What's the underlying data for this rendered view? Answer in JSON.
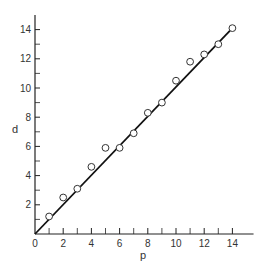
{
  "chart_data": {
    "type": "scatter",
    "title": "",
    "xlabel": "p",
    "ylabel": "d",
    "xlim": [
      0,
      15.5
    ],
    "ylim": [
      0,
      15
    ],
    "grid": false,
    "legend": null,
    "x_ticks_major": [
      0,
      2,
      4,
      6,
      8,
      10,
      12,
      14
    ],
    "x_tick_labels": [
      "0",
      "2",
      "4",
      "6",
      "8",
      "10",
      "12",
      "14"
    ],
    "x_ticks_minor": [
      1,
      3,
      5,
      7,
      9,
      11,
      13
    ],
    "y_ticks_major": [
      2,
      4,
      6,
      8,
      10,
      12,
      14
    ],
    "y_tick_labels": [
      "2",
      "4",
      "6",
      "8",
      "10",
      "12",
      "14"
    ],
    "y_ticks_minor": [
      1,
      3,
      5,
      7,
      9,
      11,
      13
    ],
    "series": [
      {
        "name": "observations",
        "marker": "open-circle",
        "x": [
          1,
          2,
          3,
          4,
          5,
          6,
          7,
          8,
          9,
          10,
          11,
          12,
          13,
          14
        ],
        "y": [
          1.2,
          2.5,
          3.1,
          4.6,
          5.9,
          5.9,
          6.9,
          8.3,
          9.0,
          10.5,
          11.8,
          12.3,
          13.0,
          14.1
        ]
      },
      {
        "name": "fitted line",
        "type": "line",
        "x": [
          0,
          14
        ],
        "y": [
          0,
          14.1
        ]
      }
    ]
  },
  "origin_label": "0"
}
